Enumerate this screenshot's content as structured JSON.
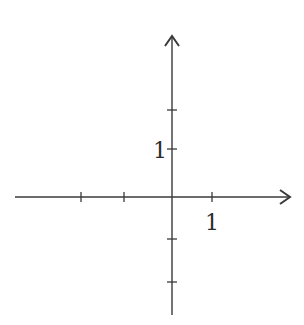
{
  "diagram": {
    "type": "cartesian-axes",
    "stroke_color": "#3a3a3a",
    "background": "#ffffff",
    "x_axis": {
      "y": 197,
      "x_start": 15,
      "x_end": 290,
      "arrow": "right",
      "ticks_px": [
        81,
        124,
        212
      ],
      "label": {
        "text": "1",
        "x": 212,
        "y": 230
      }
    },
    "y_axis": {
      "x": 172,
      "y_start": 36,
      "y_end": 315,
      "arrow": "up",
      "ticks_px": [
        110,
        149,
        239,
        282
      ],
      "label": {
        "text": "1",
        "x": 160,
        "y": 158
      }
    },
    "origin_px": [
      172,
      197
    ]
  }
}
